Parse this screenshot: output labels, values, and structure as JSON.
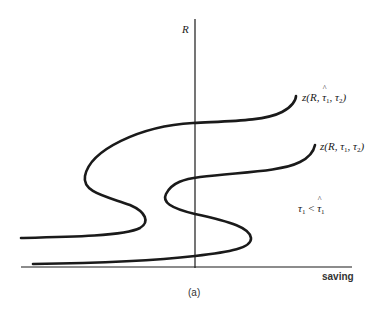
{
  "figure": {
    "panel_label": "(a)",
    "y_axis_label": "R",
    "x_axis_label": "saving",
    "condition_note": {
      "left_symbol": "τ",
      "left_sub": "1",
      "relation": "<",
      "right_symbol": "τ̂",
      "right_symbol_base": "τ",
      "right_sub": "1",
      "text": "τ1 < τ̂1"
    },
    "curves": [
      {
        "id": "upper",
        "label_text": "z(R, τ̂1, τ2)",
        "label_prefix": "z(R, ",
        "label_tau_hat": "τ",
        "label_sub1": "1",
        "label_mid": ", τ",
        "label_sub2": "2",
        "label_suffix": ")"
      },
      {
        "id": "lower",
        "label_text": "z(R, τ1, τ2)",
        "label_prefix": "z(R, τ",
        "label_sub1": "1",
        "label_mid": ", τ",
        "label_sub2": "2",
        "label_suffix": ")"
      }
    ]
  },
  "colors": {
    "ink": "#1a1a1a",
    "background": "#ffffff"
  }
}
